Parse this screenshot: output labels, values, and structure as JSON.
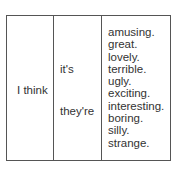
{
  "table": {
    "subject": "I think",
    "pronouns": [
      "it's",
      "they're"
    ],
    "adjectives": [
      "amusing.",
      "great.",
      "lovely.",
      "terrible.",
      "ugly.",
      "exciting.",
      "interesting.",
      "boring.",
      "silly.",
      "strange."
    ]
  }
}
